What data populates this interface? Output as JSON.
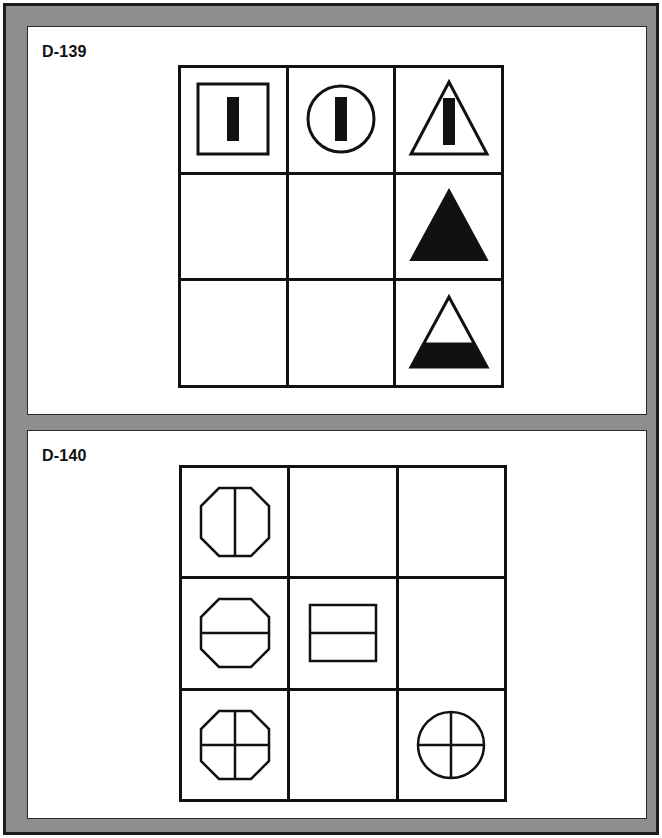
{
  "sheet": {
    "frame_color": "#8e8e8e",
    "border_color": "#1c1c1c",
    "ink_color": "#111111",
    "paper_color": "#ffffff"
  },
  "panels": [
    {
      "id": "D-139",
      "label": "D-139",
      "grid": {
        "rows": 3,
        "cols": 3,
        "cells": [
          {
            "r": 1,
            "c": 1,
            "figure": "square-outline-with-vertical-bar",
            "empty": false
          },
          {
            "r": 1,
            "c": 2,
            "figure": "circle-outline-with-vertical-bar",
            "empty": false
          },
          {
            "r": 1,
            "c": 3,
            "figure": "triangle-outline-with-vertical-bar",
            "empty": false
          },
          {
            "r": 2,
            "c": 1,
            "figure": "blank",
            "empty": true
          },
          {
            "r": 2,
            "c": 2,
            "figure": "blank",
            "empty": true
          },
          {
            "r": 2,
            "c": 3,
            "figure": "triangle-filled-solid",
            "empty": false
          },
          {
            "r": 3,
            "c": 1,
            "figure": "blank",
            "empty": true
          },
          {
            "r": 3,
            "c": 2,
            "figure": "blank",
            "empty": true
          },
          {
            "r": 3,
            "c": 3,
            "figure": "triangle-outline-bottom-filled",
            "empty": false
          }
        ]
      }
    },
    {
      "id": "D-140",
      "label": "D-140",
      "grid": {
        "rows": 3,
        "cols": 3,
        "cells": [
          {
            "r": 1,
            "c": 1,
            "figure": "octagon-with-vertical-line",
            "empty": false
          },
          {
            "r": 1,
            "c": 2,
            "figure": "blank",
            "empty": true
          },
          {
            "r": 1,
            "c": 3,
            "figure": "blank",
            "empty": true
          },
          {
            "r": 2,
            "c": 1,
            "figure": "octagon-with-horizontal-line",
            "empty": false
          },
          {
            "r": 2,
            "c": 2,
            "figure": "square-with-horizontal-line",
            "empty": false
          },
          {
            "r": 2,
            "c": 3,
            "figure": "blank",
            "empty": true
          },
          {
            "r": 3,
            "c": 1,
            "figure": "octagon-with-cross",
            "empty": false
          },
          {
            "r": 3,
            "c": 2,
            "figure": "blank",
            "empty": true
          },
          {
            "r": 3,
            "c": 3,
            "figure": "circle-with-cross",
            "empty": false
          }
        ]
      }
    }
  ]
}
